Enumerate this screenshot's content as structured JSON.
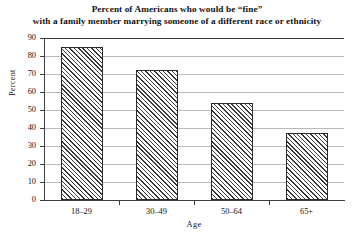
{
  "chart_data": {
    "type": "bar",
    "title": "Percent of Americans who would be “fine” with a family member marrying someone of a different race or ethnicity",
    "title_lines": [
      "Percent of Americans who would be “fine”",
      "with a family member marrying someone of a different race or ethnicity"
    ],
    "categories": [
      "18–29",
      "30–49",
      "50–64",
      "65+"
    ],
    "values": [
      85,
      72,
      54,
      37
    ],
    "xlabel": "Age",
    "ylabel": "Percent",
    "ylim": [
      0,
      90
    ],
    "ytick_step": 10,
    "yticks": [
      0,
      10,
      20,
      30,
      40,
      50,
      60,
      70,
      80,
      90
    ],
    "ytick_labels": [
      "0",
      "10",
      "20",
      "30",
      "40",
      "50",
      "60",
      "70",
      "80",
      "90"
    ],
    "grid": true,
    "grid_axis": "y",
    "legend": null,
    "bar_fill": "diagonal-hatch",
    "bar_edge_color": "#2b2b2b",
    "grid_color": "#b9b9b9",
    "axis_color": "#3d3d3d",
    "background_color": "#ffffff"
  }
}
